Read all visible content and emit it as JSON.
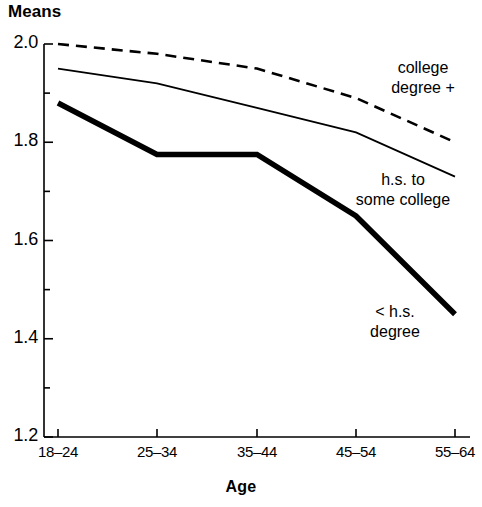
{
  "chart_data": {
    "type": "line",
    "title": "Means",
    "subtitle": "",
    "xlabel": "Age",
    "ylabel": "Means",
    "categories": [
      "18–24",
      "25–34",
      "35–44",
      "45–54",
      "55–64"
    ],
    "ylim": [
      1.2,
      2.0
    ],
    "ytick_labels": [
      "2.0",
      "1.8",
      "1.6",
      "1.4",
      "1.2"
    ],
    "ytick_values": [
      2.0,
      1.8,
      1.6,
      1.4,
      1.2
    ],
    "yminor_values": [
      1.9,
      1.7,
      1.5,
      1.3
    ],
    "grid": false,
    "legend_position": "inline-right",
    "series": [
      {
        "name": "college degree +",
        "label_lines": [
          "college",
          "degree +"
        ],
        "style": "dashed",
        "color": "#000000",
        "width": 2.6,
        "values": [
          2.0,
          1.98,
          1.95,
          1.89,
          1.8
        ]
      },
      {
        "name": "h.s. to some college",
        "label_lines": [
          "h.s. to",
          "some college"
        ],
        "style": "solid-thin",
        "color": "#000000",
        "width": 1.8,
        "values": [
          1.95,
          1.92,
          1.87,
          1.82,
          1.73
        ]
      },
      {
        "name": "< h.s. degree",
        "label_lines": [
          "< h.s.",
          "degree"
        ],
        "style": "solid-thick",
        "color": "#000000",
        "width": 5.5,
        "values": [
          1.88,
          1.775,
          1.775,
          1.65,
          1.45
        ]
      }
    ]
  },
  "axis": {
    "y_title": "Means",
    "x_title": "Age"
  },
  "labels": {
    "y_ticks": [
      "2.0",
      "1.8",
      "1.6",
      "1.4",
      "1.2"
    ],
    "x_ticks": [
      "18–24",
      "25–34",
      "35–44",
      "45–54",
      "55–64"
    ],
    "series_college_line1": "college",
    "series_college_line2": "degree +",
    "series_hs_line1": "h.s. to",
    "series_hs_line2": "some college",
    "series_lths_line1": "< h.s.",
    "series_lths_line2": "degree"
  }
}
